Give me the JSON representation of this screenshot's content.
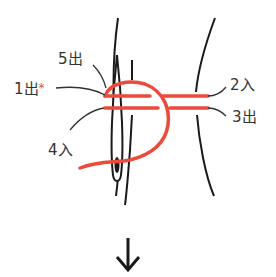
{
  "diagram": {
    "title": "",
    "labels": {
      "step5": "5出",
      "step1": "1出",
      "step1_mark": "*",
      "step2": "2入",
      "step3": "3出",
      "step4": "4入"
    },
    "colors": {
      "thread": "#ec4a3c",
      "outline": "#1a1a1a",
      "label": "#333333",
      "mark": "#e84a3e"
    },
    "icons": {
      "next_step": "down-arrow-icon",
      "needle": "needle-icon"
    }
  }
}
